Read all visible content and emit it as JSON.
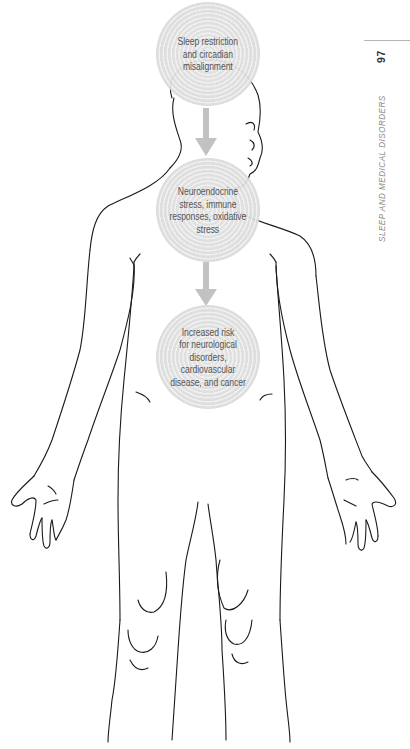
{
  "running_head": {
    "section_title": "SLEEP AND MEDICAL DISORDERS",
    "page_number": "97"
  },
  "figure": {
    "steps": [
      {
        "id": "step-1",
        "text": "Sleep restriction\nand circadian\nmisalignment"
      },
      {
        "id": "step-2",
        "text": "Neuroendocrine\nstress, immune\nresponses, oxidative\nstress"
      },
      {
        "id": "step-3",
        "text": "Increased risk\nfor neurological\ndisorders, cardiovascular\ndisease, and cancer"
      }
    ],
    "arrows": [
      {
        "from": "step-1",
        "to": "step-2",
        "icon": "down-arrow-icon"
      },
      {
        "from": "step-2",
        "to": "step-3",
        "icon": "down-arrow-icon"
      }
    ],
    "colors": {
      "bubble_fill": "#dcdcdc",
      "bubble_text": "#4a4a4a",
      "arrow": "#bdbdbd",
      "line_art": "#1a1a1a",
      "running_head_text": "#8a8a8a",
      "page_number": "#333333"
    }
  }
}
